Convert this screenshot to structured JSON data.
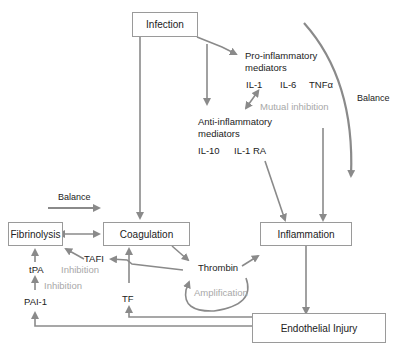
{
  "nodes": {
    "infection": "Infection",
    "coagulation": "Coagulation",
    "fibrinolysis": "Fibrinolysis",
    "inflammation": "Inflammation",
    "endothelial_injury": "Endothelial Injury"
  },
  "labels": {
    "pro_inflammatory_1": "Pro-inflammatory",
    "pro_inflammatory_2": "mediators",
    "il1": "IL-1",
    "il6": "IL-6",
    "tnfa": "TNFα",
    "mutual_inhibition": "Mutual inhibition",
    "anti_inflammatory_1": "Anti-inflammatory",
    "anti_inflammatory_2": "mediators",
    "il10": "IL-10",
    "il1ra": "IL-1 RA",
    "balance_right": "Balance",
    "balance_left": "Balance",
    "tafi": "TAFI",
    "tpa": "tPA",
    "inhibition_tafi": "Inhibition",
    "inhibition_pai": "Inhibition",
    "pai1": "PAI-1",
    "thrombin": "Thrombin",
    "amplification": "Amplification",
    "tf": "TF"
  },
  "colors": {
    "arrow": "#8a8a8a",
    "box_border": "#9a9a9a",
    "muted_text": "#a8a8a8"
  }
}
